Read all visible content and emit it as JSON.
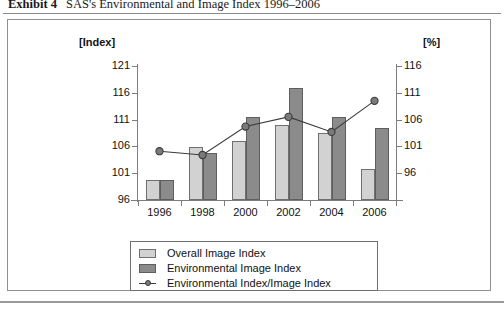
{
  "exhibit": {
    "label": "Exhibit 4",
    "caption": "SAS's Environmental and Image Index 1996–2006"
  },
  "axes": {
    "left_unit": "[Index]",
    "right_unit": "[%]",
    "left_ticks": [
      "121",
      "116",
      "111",
      "106",
      "101",
      "96"
    ],
    "right_ticks": [
      "116",
      "111",
      "106",
      "101",
      "96"
    ]
  },
  "legend": {
    "items": [
      {
        "label": "Overall Image Index",
        "marker": "light-swatch",
        "color": "#d2d2d2"
      },
      {
        "label": "Environmental Image Index",
        "marker": "dark-swatch",
        "color": "#8b8b8b"
      },
      {
        "label": "Environmental Index/Image Index",
        "marker": "line-marker",
        "color": "#3a3a3a"
      }
    ]
  },
  "colors": {
    "overall_bar": "#d2d2d2",
    "environmental_bar": "#8b8b8b",
    "ratio_line": "#3a3a3a",
    "ratio_marker_fill": "#7a7a7a",
    "axis": "#7d7d7d",
    "frame": "#8e8e8e"
  },
  "chart_data": {
    "type": "bar",
    "title": "SAS's Environmental and Image Index 1996–2006",
    "xlabel": "",
    "ylabel": "[Index]",
    "y2label": "[%]",
    "categories": [
      "1996",
      "1998",
      "2000",
      "2002",
      "2004",
      "2006"
    ],
    "ylim": [
      96,
      121
    ],
    "y2lim": [
      91,
      116
    ],
    "yticks": [
      96,
      101,
      106,
      111,
      116,
      121
    ],
    "y2ticks": [
      96,
      101,
      106,
      111,
      116
    ],
    "grid": false,
    "legend_position": "bottom",
    "series": [
      {
        "name": "Overall Image Index",
        "type": "bar",
        "axis": "left",
        "values": [
          99.8,
          105.9,
          107.0,
          110.0,
          108.5,
          101.7
        ]
      },
      {
        "name": "Environmental Image Index",
        "type": "bar",
        "axis": "left",
        "values": [
          99.8,
          104.8,
          111.5,
          116.9,
          111.5,
          109.5
        ]
      },
      {
        "name": "Environmental Index/Image Index",
        "type": "line",
        "axis": "right",
        "values": [
          100.1,
          99.4,
          104.7,
          106.5,
          103.7,
          109.5
        ]
      }
    ]
  }
}
